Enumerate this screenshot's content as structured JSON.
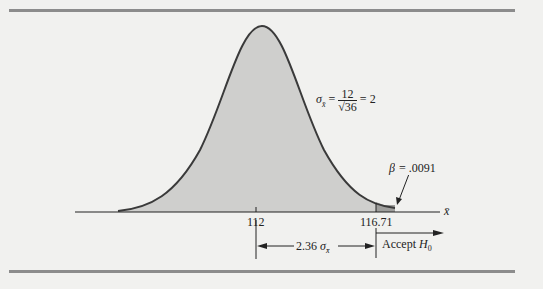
{
  "figure": {
    "sigma_label": "σ",
    "sigma_sub": "x̄",
    "sigma_eq": "=",
    "sigma_num": "12",
    "sigma_den": "√36",
    "sigma_result": "= 2",
    "beta_label": "β = .0091",
    "axis_label": "x̄",
    "tick_mean": "112",
    "tick_crit": "116.71",
    "distance_value": "2.36",
    "distance_sigma": "σ",
    "distance_sub": "x̄",
    "accept_label": "Accept",
    "accept_h": "H",
    "accept_sub": "0"
  },
  "colors": {
    "background": "#f1f1ef",
    "curve_fill": "#cfcfcd",
    "beta_fill": "#9e9e9c",
    "curve_stroke": "#3a3a3a",
    "rule": "#8c8c8c"
  }
}
